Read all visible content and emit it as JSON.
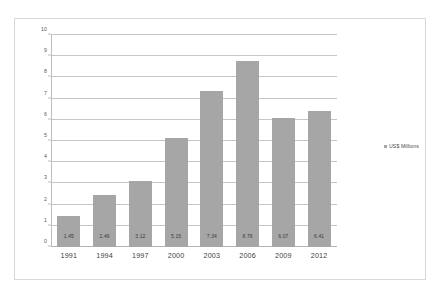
{
  "chart_data": {
    "type": "bar",
    "title": "",
    "xlabel": "",
    "ylabel": "",
    "categories": [
      "1991",
      "1994",
      "1997",
      "2000",
      "2003",
      "2006",
      "2009",
      "2012"
    ],
    "values": [
      1.45,
      2.46,
      3.12,
      5.15,
      7.34,
      8.76,
      6.07,
      6.41
    ],
    "value_labels": [
      "1.45",
      "2.46",
      "3.12",
      "5.15",
      "7.34",
      "8.76",
      "6.07",
      "6.41"
    ],
    "ylim": [
      0,
      10
    ],
    "y_ticks": [
      0,
      1,
      2,
      3,
      4,
      5,
      6,
      7,
      8,
      9,
      10
    ],
    "y_tick_labels": [
      "0",
      "1",
      "2",
      "3",
      "4",
      "5",
      "6",
      "7",
      "8",
      "9",
      "10"
    ],
    "grid": "horizontal",
    "legend_position": "right",
    "series": [
      {
        "name": "US$ Millions",
        "values": [
          1.45,
          2.46,
          3.12,
          5.15,
          7.34,
          8.76,
          6.07,
          6.41
        ],
        "color": "#a6a6a6"
      }
    ]
  },
  "legend": {
    "entries": [
      {
        "label": "US$ Millions",
        "color": "#a6a6a6"
      }
    ]
  },
  "colors": {
    "bar": "#a6a6a6",
    "gridline": "#c6c6c6",
    "axis": "#bdbdbd",
    "frame": "#d8d8d8",
    "background": "#ffffff",
    "tick_text": "#58585a",
    "category_text": "#3f3f41",
    "value_text": "#3a3a3a"
  }
}
